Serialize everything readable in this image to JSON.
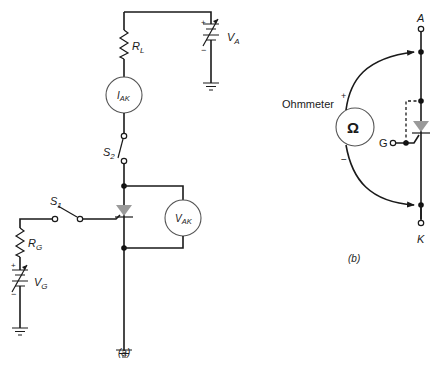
{
  "figure_a": {
    "caption": "(a)",
    "load_resistor": {
      "label": "R",
      "sub": "L"
    },
    "anode_supply": {
      "label": "V",
      "sub": "A",
      "plus": "+",
      "minus": "−"
    },
    "current_meter": {
      "label": "I",
      "sub": "AK"
    },
    "voltage_meter": {
      "label": "V",
      "sub": "AK"
    },
    "switch_anode": {
      "label": "S",
      "sub": "2"
    },
    "switch_gate": {
      "label": "S",
      "sub": "1"
    },
    "gate_resistor": {
      "label": "R",
      "sub": "G"
    },
    "gate_supply": {
      "label": "V",
      "sub": "G",
      "plus": "+",
      "minus": "−"
    }
  },
  "figure_b": {
    "caption": "(b)",
    "instrument_label": "Ohmmeter",
    "instrument_symbol": "Ω",
    "plus": "+",
    "minus": "−",
    "anode_terminal": "A",
    "cathode_terminal": "K",
    "gate_terminal": "G"
  },
  "colors": {
    "wire": "#1a1a1a",
    "scr_body": "#9a9a9a",
    "meter_outline": "#555555"
  }
}
